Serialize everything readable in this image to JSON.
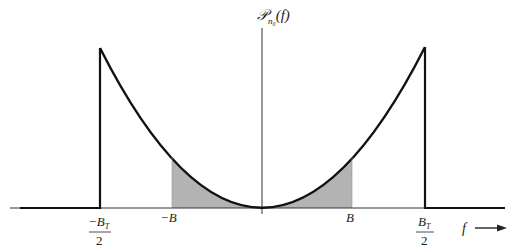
{
  "figure": {
    "y_axis_label": {
      "main": "𝒫",
      "sub": "n₀",
      "arg": "(f)"
    },
    "x_axis_label": "f",
    "tick_labels": {
      "neg_bt_half": {
        "num": "−B",
        "sub": "T",
        "den": "2"
      },
      "neg_b": "−B",
      "pos_b": "B",
      "pos_bt_half": {
        "num": "B",
        "sub": "T",
        "den": "2"
      }
    },
    "colors": {
      "curve": "#111111",
      "shade": "#b3b3b3",
      "axis": "#333333"
    }
  }
}
